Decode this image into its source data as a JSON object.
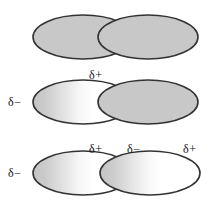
{
  "figure": {
    "background_color": "#ffffff",
    "outline_color": "#333333",
    "gray_fill": "#c8c8c8",
    "white_fill": "#ffffff",
    "rows": [
      {
        "id": "row-nonpolar-pair",
        "description": "two uniform gray electron clouds in contact",
        "ellipses": [
          {
            "id": "left",
            "fill": "solid-gray"
          },
          {
            "id": "right",
            "fill": "solid-gray"
          }
        ],
        "labels": []
      },
      {
        "id": "row-one-induced-dipole",
        "description": "left cloud polarized, right cloud uniform gray",
        "ellipses": [
          {
            "id": "left",
            "fill": "gradient-gray-to-white"
          },
          {
            "id": "right",
            "fill": "solid-gray"
          }
        ],
        "labels": [
          {
            "id": "left-negative",
            "text": "δ−"
          },
          {
            "id": "top-positive",
            "text": "δ+"
          }
        ]
      },
      {
        "id": "row-two-induced-dipoles",
        "description": "both clouds polarized in the same direction",
        "ellipses": [
          {
            "id": "left",
            "fill": "gradient-gray-to-white"
          },
          {
            "id": "right",
            "fill": "gradient-gray-to-white"
          }
        ],
        "labels": [
          {
            "id": "left-negative",
            "text": "δ−"
          },
          {
            "id": "mid-positive",
            "text": "δ+"
          },
          {
            "id": "mid-negative",
            "text": "δ−"
          },
          {
            "id": "right-positive",
            "text": "δ+"
          }
        ]
      }
    ]
  }
}
